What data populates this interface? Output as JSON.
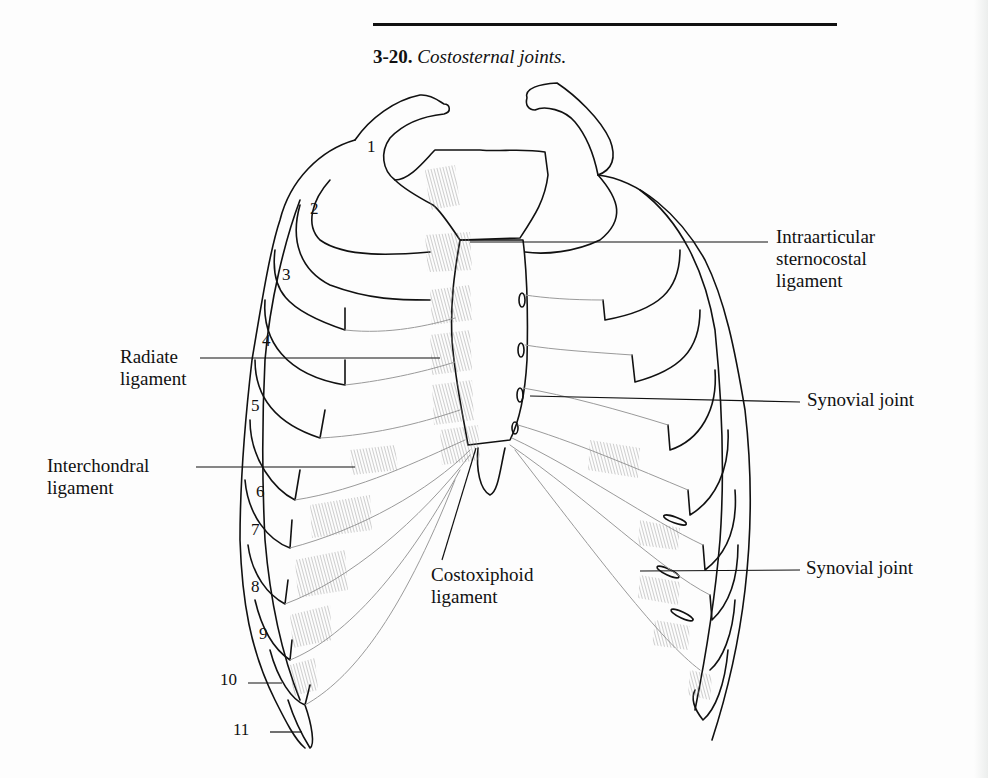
{
  "figure": {
    "number": "3-20.",
    "title": "Costosternal joints."
  },
  "labels": {
    "intraarticular": [
      "Intraarticular",
      "sternocostal",
      "ligament"
    ],
    "synovial_upper": "Synovial joint",
    "synovial_lower": "Synovial joint",
    "radiate": [
      "Radiate",
      "ligament"
    ],
    "interchondral": [
      "Interchondral",
      "ligament"
    ],
    "costoxiphoid": [
      "Costoxiphoid",
      "ligament"
    ]
  },
  "rib_numbers": [
    "1",
    "2",
    "3",
    "4",
    "5",
    "6",
    "7",
    "8",
    "9",
    "10",
    "11"
  ],
  "colors": {
    "line": "#111111",
    "cartilage_line": "#9a9a9a",
    "ligament_hatch": "#8a8a8a",
    "background": "#fdfdfd"
  }
}
